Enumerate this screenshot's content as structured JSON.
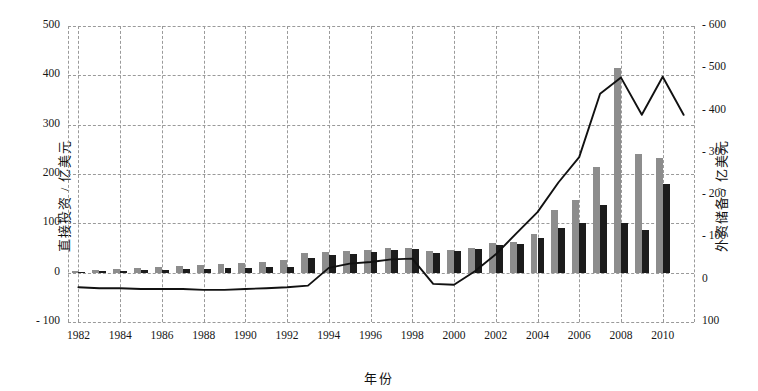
{
  "chart_data": {
    "type": "bar",
    "title": "",
    "subtitle": "",
    "xlabel": "年份",
    "ylabel": "直接投资 / 亿美元",
    "y2label": "外资储备 / 亿美元",
    "grid": true,
    "legend_position": "none",
    "x": [
      1982,
      1983,
      1984,
      1985,
      1986,
      1987,
      1988,
      1989,
      1990,
      1991,
      1992,
      1993,
      1994,
      1995,
      1996,
      1997,
      1998,
      1999,
      2000,
      2001,
      2002,
      2003,
      2004,
      2005,
      2006,
      2007,
      2008,
      2009,
      2010,
      2011
    ],
    "xtick_labels": [
      "1982",
      "1984",
      "1986",
      "1988",
      "1990",
      "1992",
      "1994",
      "1996",
      "1998",
      "2000",
      "2002",
      "2004",
      "2006",
      "2008",
      "2010"
    ],
    "ytick_labels": [
      "500",
      "400",
      "300",
      "200",
      "100",
      "0",
      "- 100"
    ],
    "y2tick_labels": [
      "- 600",
      "- 500",
      "- 400",
      "- 300",
      "- 200",
      "- 100",
      "0",
      "100"
    ],
    "ylim": [
      -100,
      500
    ],
    "y2lim": [
      -100,
      600
    ],
    "series": [
      {
        "name": "外商直接投资",
        "type": "bar",
        "color": "#8d8d8d",
        "axis": "left",
        "values": [
          4,
          6,
          7,
          10,
          12,
          14,
          16,
          18,
          20,
          22,
          25,
          40,
          42,
          44,
          47,
          50,
          50,
          44,
          46,
          50,
          60,
          62,
          78,
          128,
          148,
          215,
          415,
          240,
          232,
          0
        ]
      },
      {
        "name": "对外直接投资",
        "type": "bar",
        "color": "#1c1c1c",
        "axis": "left",
        "values": [
          2,
          3,
          4,
          5,
          6,
          7,
          8,
          9,
          10,
          11,
          12,
          30,
          36,
          38,
          42,
          46,
          48,
          40,
          44,
          48,
          56,
          58,
          70,
          90,
          100,
          138,
          100,
          86,
          180,
          0
        ]
      },
      {
        "name": "外汇储备",
        "type": "line",
        "color": "#111111",
        "axis": "right",
        "values": [
          -18,
          -20,
          -20,
          -22,
          -22,
          -22,
          -24,
          -24,
          -22,
          -20,
          -18,
          -14,
          28,
          38,
          42,
          48,
          50,
          -10,
          -12,
          20,
          60,
          110,
          160,
          230,
          290,
          440,
          478,
          390,
          480,
          390
        ]
      }
    ]
  }
}
